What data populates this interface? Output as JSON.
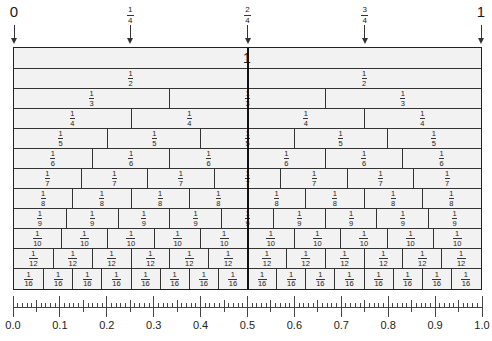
{
  "diagram": {
    "top_markers": [
      {
        "position": 0,
        "type": "whole",
        "label": "0"
      },
      {
        "position": 0.25,
        "type": "fraction",
        "numerator": "1",
        "denominator": "4"
      },
      {
        "position": 0.5,
        "type": "fraction",
        "numerator": "2",
        "denominator": "4"
      },
      {
        "position": 0.75,
        "type": "fraction",
        "numerator": "3",
        "denominator": "4"
      },
      {
        "position": 1,
        "type": "whole",
        "label": "1"
      }
    ],
    "rows": [
      {
        "denominator": 1,
        "label": "1"
      },
      {
        "denominator": 2,
        "numerator": "1",
        "den_label": "2"
      },
      {
        "denominator": 3,
        "numerator": "1",
        "den_label": "3"
      },
      {
        "denominator": 4,
        "numerator": "1",
        "den_label": "4"
      },
      {
        "denominator": 5,
        "numerator": "1",
        "den_label": "5"
      },
      {
        "denominator": 6,
        "numerator": "1",
        "den_label": "6"
      },
      {
        "denominator": 7,
        "numerator": "1",
        "den_label": "7"
      },
      {
        "denominator": 8,
        "numerator": "1",
        "den_label": "8"
      },
      {
        "denominator": 9,
        "numerator": "1",
        "den_label": "9"
      },
      {
        "denominator": 10,
        "numerator": "1",
        "den_label": "10"
      },
      {
        "denominator": 12,
        "numerator": "1",
        "den_label": "12"
      },
      {
        "denominator": 16,
        "numerator": "1",
        "den_label": "16"
      }
    ],
    "ruler": {
      "min": 0.0,
      "max": 1.0,
      "minor_step": 0.01,
      "mid_step": 0.05,
      "major_step": 0.1,
      "labels": [
        "0.0",
        "0.1",
        "0.2",
        "0.3",
        "0.4",
        "0.5",
        "0.6",
        "0.7",
        "0.8",
        "0.9",
        "1.0"
      ]
    },
    "colors": {
      "cell_fill": "#f2f2f2",
      "line": "#333333",
      "text": "#1a1a1a",
      "background": "#ffffff"
    }
  }
}
